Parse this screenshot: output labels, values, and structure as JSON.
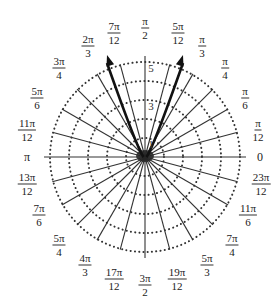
{
  "figure": {
    "type": "polar-grid",
    "center": [
      145,
      157
    ],
    "ring_count": 5,
    "ring_spacing_px": 19,
    "spoke_step": "pi/12",
    "colors": {
      "grid": "#333333",
      "dots": "#333333",
      "vector": "#111111",
      "background": "#ffffff"
    }
  },
  "radial_labels": [
    {
      "text": "1",
      "r": 1
    },
    {
      "text": "3",
      "r": 3
    },
    {
      "text": "5",
      "r": 5
    }
  ],
  "angle_labels": [
    {
      "id": "a0",
      "num": "0",
      "den": "",
      "x": 260,
      "y": 157
    },
    {
      "id": "a1",
      "num": "π",
      "den": "12",
      "x": 258,
      "y": 130
    },
    {
      "id": "a2",
      "num": "π",
      "den": "6",
      "x": 245,
      "y": 98
    },
    {
      "id": "a3",
      "num": "π",
      "den": "4",
      "x": 225,
      "y": 68
    },
    {
      "id": "a4",
      "num": "π",
      "den": "3",
      "x": 202,
      "y": 46
    },
    {
      "id": "a5",
      "num": "5π",
      "den": "12",
      "x": 178,
      "y": 33
    },
    {
      "id": "a6",
      "num": "π",
      "den": "2",
      "x": 145,
      "y": 28
    },
    {
      "id": "a7",
      "num": "7π",
      "den": "12",
      "x": 114,
      "y": 33
    },
    {
      "id": "a8",
      "num": "2π",
      "den": "3",
      "x": 88,
      "y": 46
    },
    {
      "id": "a9",
      "num": "3π",
      "den": "4",
      "x": 59,
      "y": 68
    },
    {
      "id": "a10",
      "num": "5π",
      "den": "6",
      "x": 37,
      "y": 98
    },
    {
      "id": "a11",
      "num": "11π",
      "den": "12",
      "x": 27,
      "y": 130
    },
    {
      "id": "a12",
      "num": "π",
      "den": "",
      "x": 27,
      "y": 157
    },
    {
      "id": "a13",
      "num": "13π",
      "den": "12",
      "x": 27,
      "y": 184
    },
    {
      "id": "a14",
      "num": "7π",
      "den": "6",
      "x": 39,
      "y": 215
    },
    {
      "id": "a15",
      "num": "5π",
      "den": "4",
      "x": 59,
      "y": 245
    },
    {
      "id": "a16",
      "num": "4π",
      "den": "3",
      "x": 85,
      "y": 265
    },
    {
      "id": "a17",
      "num": "17π",
      "den": "12",
      "x": 114,
      "y": 279
    },
    {
      "id": "a18",
      "num": "3π",
      "den": "2",
      "x": 145,
      "y": 285
    },
    {
      "id": "a19",
      "num": "19π",
      "den": "12",
      "x": 177,
      "y": 279
    },
    {
      "id": "a20",
      "num": "5π",
      "den": "3",
      "x": 207,
      "y": 265
    },
    {
      "id": "a21",
      "num": "7π",
      "den": "4",
      "x": 232,
      "y": 245
    },
    {
      "id": "a22",
      "num": "11π",
      "den": "6",
      "x": 248,
      "y": 215
    },
    {
      "id": "a23",
      "num": "23π",
      "den": "12",
      "x": 261,
      "y": 184
    }
  ],
  "vectors": [
    {
      "name": "left-vector",
      "from": [
        138,
        153
      ],
      "to": [
        107,
        55
      ],
      "direction": "2π/3 side"
    },
    {
      "name": "right-vector",
      "from": [
        152,
        153
      ],
      "to": [
        183,
        55
      ],
      "direction": "π/3 side"
    }
  ]
}
